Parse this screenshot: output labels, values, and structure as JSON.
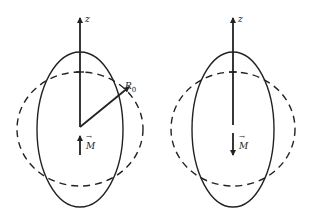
{
  "figures": [
    {
      "id": "left",
      "axis_label": "z",
      "radius_label_main": "R",
      "radius_label_sub": "0",
      "moment_label": "M",
      "moment_direction": "up"
    },
    {
      "id": "right",
      "axis_label": "z",
      "moment_label": "M",
      "moment_direction": "down"
    }
  ],
  "colors": {
    "stroke": "#222222",
    "background": "#ffffff"
  }
}
